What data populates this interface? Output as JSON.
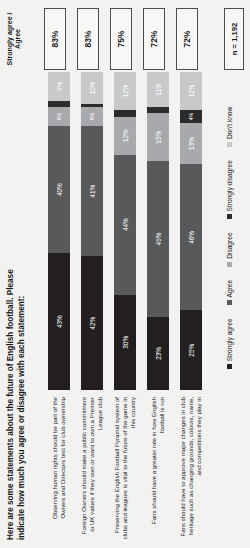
{
  "title": "Here are some statements about the future of English football.  Please indicate how much you agree or disagree with each statement:",
  "column_header": "Strongly agree / Agree",
  "sample_note": "n = 1,192",
  "legend": [
    {
      "key": "sa",
      "label": "Strongly agree",
      "color": "#231f20"
    },
    {
      "key": "ag",
      "label": "Agree",
      "color": "#58595b"
    },
    {
      "key": "di",
      "label": "Disagree",
      "color": "#a7a9ac"
    },
    {
      "key": "sd",
      "label": "Strongly disagree",
      "color": "#2b2b2b"
    },
    {
      "key": "dk",
      "label": "Don't know",
      "color": "#c7c9cb"
    }
  ],
  "chart_data": {
    "type": "bar",
    "subtype": "stacked-horizontal-100pct",
    "title": "Here are some statements about the future of English football.  Please indicate how much you agree or disagree with each statement:",
    "xlabel": "",
    "ylabel": "",
    "xlim": [
      0,
      100
    ],
    "grid": false,
    "legend_position": "bottom",
    "sample_size": "n = 1,192",
    "categories": [
      "Observing human rights should be part of the Owners and Directors test for club ownership",
      "Foreign Owners should make a public commitment to UK values if they own or want to own a Premier League club",
      "Preserving the English Football Pyramid system of clubs and leagues is vital to the future of the game in this country",
      "Fans should have a greater role in how English football is run",
      "Fans should have to approve major changes in club heritage such as changing grounds, colours, name, and competitions they play in"
    ],
    "series": [
      {
        "name": "Strongly agree",
        "values": [
          43,
          42,
          30,
          23,
          25
        ]
      },
      {
        "name": "Agree",
        "values": [
          40,
          41,
          44,
          49,
          46
        ]
      },
      {
        "name": "Disagree",
        "values": [
          6,
          6,
          12,
          15,
          13
        ]
      },
      {
        "name": "Strongly disagree",
        "values": [
          2,
          1,
          2,
          2,
          4
        ]
      },
      {
        "name": "Don't know",
        "values": [
          9,
          10,
          12,
          11,
          12
        ]
      }
    ],
    "totals_label": "Strongly agree / Agree",
    "totals": [
      "83%",
      "83%",
      "75%",
      "72%",
      "72%"
    ]
  },
  "rows": [
    {
      "label": "Observing human rights should be part of the Owners and Directors test for club ownership",
      "total": "83%",
      "segments": [
        {
          "key": "sa",
          "label": "43%",
          "value": 43
        },
        {
          "key": "ag",
          "label": "40%",
          "value": 40
        },
        {
          "key": "di",
          "label": "6%",
          "value": 6
        },
        {
          "key": "sd",
          "label": "2%",
          "value": 2
        },
        {
          "key": "dk",
          "label": "9%",
          "value": 9
        }
      ]
    },
    {
      "label": "Foreign Owners should make a public commitment to UK values if they own or want to own a Premier League club",
      "total": "83%",
      "segments": [
        {
          "key": "sa",
          "label": "42%",
          "value": 42
        },
        {
          "key": "ag",
          "label": "41%",
          "value": 41
        },
        {
          "key": "di",
          "label": "6%",
          "value": 6
        },
        {
          "key": "sd",
          "label": "1%",
          "value": 1
        },
        {
          "key": "dk",
          "label": "10%",
          "value": 10
        }
      ]
    },
    {
      "label": "Preserving the English Football Pyramid system of clubs and leagues is vital to the future of the game in this country",
      "total": "75%",
      "segments": [
        {
          "key": "sa",
          "label": "30%",
          "value": 30
        },
        {
          "key": "ag",
          "label": "44%",
          "value": 44
        },
        {
          "key": "di",
          "label": "12%",
          "value": 12
        },
        {
          "key": "sd",
          "label": "2%",
          "value": 2
        },
        {
          "key": "dk",
          "label": "12%",
          "value": 12
        }
      ]
    },
    {
      "label": "Fans should have a greater role in how English football is run",
      "total": "72%",
      "segments": [
        {
          "key": "sa",
          "label": "23%",
          "value": 23
        },
        {
          "key": "ag",
          "label": "49%",
          "value": 49
        },
        {
          "key": "di",
          "label": "15%",
          "value": 15
        },
        {
          "key": "sd",
          "label": "2%",
          "value": 2
        },
        {
          "key": "dk",
          "label": "11%",
          "value": 11
        }
      ]
    },
    {
      "label": "Fans should have to approve major changes in club heritage such as changing grounds, colours, name, and competitions they play in",
      "total": "72%",
      "segments": [
        {
          "key": "sa",
          "label": "25%",
          "value": 25
        },
        {
          "key": "ag",
          "label": "46%",
          "value": 46
        },
        {
          "key": "di",
          "label": "13%",
          "value": 13
        },
        {
          "key": "sd",
          "label": "4%",
          "value": 4
        },
        {
          "key": "dk",
          "label": "12%",
          "value": 12
        }
      ]
    }
  ]
}
